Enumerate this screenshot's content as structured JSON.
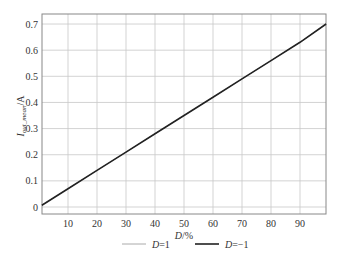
{
  "chart_data": {
    "type": "line",
    "title": "",
    "xlabel": "D/%",
    "ylabel": "I_out_mean/A",
    "ylabel_main": "I",
    "ylabel_sub": "out_mean",
    "ylabel_unit": "/A",
    "xlabel_var": "D",
    "xlabel_unit": "/%",
    "xlim": [
      0,
      99
    ],
    "ylim": [
      -0.01,
      0.74
    ],
    "grid": true,
    "legend_position": "bottom",
    "x_ticks": [
      10,
      20,
      30,
      40,
      50,
      60,
      70,
      80,
      90
    ],
    "y_ticks": [
      0,
      0.1,
      0.2,
      0.3,
      0.4,
      0.5,
      0.6,
      0.7
    ],
    "x_tick_labels": [
      "10",
      "20",
      "30",
      "40",
      "50",
      "60",
      "70",
      "80",
      "90"
    ],
    "y_tick_labels": [
      "0",
      "0.1",
      "0.2",
      "0.3",
      "0.4",
      "0.5",
      "0.6",
      "0.7"
    ],
    "series": [
      {
        "name": "D=1",
        "label_var": "D",
        "label_val": "=1",
        "color": "#aaaaaa",
        "line_width": 1,
        "x": [
          1,
          10,
          20,
          30,
          40,
          50,
          60,
          70,
          80,
          90,
          99
        ],
        "values": [
          0.007,
          0.07,
          0.14,
          0.21,
          0.28,
          0.35,
          0.42,
          0.49,
          0.56,
          0.63,
          0.7
        ]
      },
      {
        "name": "D=-1",
        "label_var": "D",
        "label_val": "=−1",
        "color": "#222222",
        "line_width": 1.6,
        "x": [
          1,
          10,
          20,
          30,
          40,
          50,
          60,
          70,
          80,
          90,
          99
        ],
        "values": [
          0.007,
          0.07,
          0.14,
          0.21,
          0.28,
          0.35,
          0.42,
          0.49,
          0.56,
          0.63,
          0.7
        ]
      }
    ]
  }
}
